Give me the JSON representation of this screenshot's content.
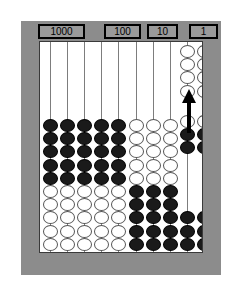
{
  "figure": {
    "kind": "abacus-diagram",
    "colors": {
      "frame": "#8c8c8c",
      "board": "#ffffff",
      "rod": "#7d7d7d",
      "bead_dark": "#1a1a1a",
      "bead_light": "#ffffff",
      "outline": "#000000"
    }
  },
  "place_labels": [
    {
      "text": "1000",
      "left": 17,
      "width": 47
    },
    {
      "text": "100",
      "left": 83,
      "width": 37
    },
    {
      "text": "10",
      "left": 126,
      "width": 31
    },
    {
      "text": "1",
      "left": 168,
      "width": 29
    }
  ],
  "rods": [
    {
      "index": 1,
      "x": 10,
      "dark_top": 5,
      "light_bottom": 5,
      "light_top": 0,
      "dark_bottom": 0
    },
    {
      "index": 2,
      "x": 27,
      "dark_top": 5,
      "light_bottom": 5,
      "light_top": 0,
      "dark_bottom": 0
    },
    {
      "index": 3,
      "x": 44,
      "dark_top": 5,
      "light_bottom": 5,
      "light_top": 0,
      "dark_bottom": 0
    },
    {
      "index": 4,
      "x": 61,
      "dark_top": 5,
      "light_bottom": 5,
      "light_top": 0,
      "dark_bottom": 0
    },
    {
      "index": 5,
      "x": 78,
      "dark_top": 5,
      "light_bottom": 5,
      "light_top": 0,
      "dark_bottom": 0
    },
    {
      "index": 6,
      "x": 96,
      "dark_top": 0,
      "light_bottom": 0,
      "light_top": 5,
      "dark_bottom": 5
    },
    {
      "index": 7,
      "x": 113,
      "dark_top": 0,
      "light_bottom": 0,
      "light_top": 5,
      "dark_bottom": 5
    },
    {
      "index": 8,
      "x": 130,
      "dark_top": 0,
      "light_bottom": 0,
      "light_top": 5,
      "dark_bottom": 5
    },
    {
      "index": 9,
      "x": 147,
      "dark_top": 0,
      "light_bottom": 0,
      "light_top": 0,
      "dark_bottom": 0
    },
    {
      "index": 10,
      "x": 164,
      "dark_top": 0,
      "light_bottom": 0,
      "light_top": 0,
      "dark_bottom": 0
    }
  ],
  "ones_columns": [
    {
      "rod_x": 147,
      "light_top": 4,
      "light_mid": 1,
      "dark_mid": 2,
      "dark_bottom": 3
    },
    {
      "rod_x": 164,
      "light_top": 4,
      "light_mid": 1,
      "dark_mid": 2,
      "dark_bottom": 3
    }
  ],
  "annotation": {
    "arrow": {
      "direction": "up",
      "x": 149,
      "y": 47,
      "length": 44
    }
  }
}
